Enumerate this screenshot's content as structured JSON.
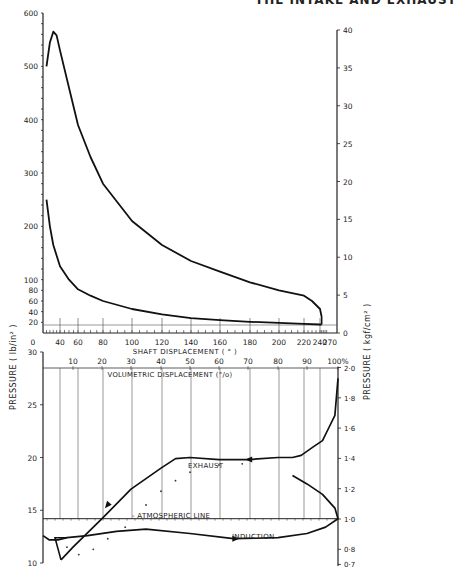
{
  "header": {
    "running_title": "THE INTAKE AND EXHAUST"
  },
  "chart_data": [
    {
      "type": "line",
      "title": "Cylinder pressure vs shaft displacement",
      "xlabel": "SHAFT DISPLACEMENT (°)",
      "ylabel": "PRESSURE (lb/in²)",
      "ylabel_right": "PRESSURE (kgf/cm²)",
      "xlim": [
        0,
        270
      ],
      "ylim": [
        0,
        600
      ],
      "ylim_right": [
        0,
        40
      ],
      "x_ticks": [
        "0",
        "40",
        "60",
        "80",
        "100",
        "120",
        "140",
        "160",
        "180",
        "200",
        "220",
        "240",
        "270"
      ],
      "y_ticks": [
        "20",
        "40",
        "60",
        "80",
        "100",
        "200",
        "300",
        "400",
        "500",
        "600"
      ],
      "y_ticks_right": [
        "0",
        "5",
        "10",
        "15",
        "20",
        "25",
        "30",
        "35",
        "40"
      ],
      "grid": false,
      "series": [
        {
          "name": "Expansion (upper curve)",
          "x": [
            20,
            25,
            30,
            35,
            40,
            50,
            60,
            70,
            80,
            100,
            120,
            140,
            160,
            180,
            200,
            220,
            230,
            240,
            245
          ],
          "values": [
            500,
            545,
            565,
            558,
            530,
            460,
            390,
            330,
            280,
            210,
            165,
            135,
            115,
            95,
            80,
            70,
            60,
            45,
            30
          ]
        },
        {
          "name": "Compression (lower curve)",
          "x": [
            20,
            25,
            30,
            40,
            50,
            60,
            70,
            80,
            100,
            120,
            140,
            160,
            180,
            200,
            220,
            240,
            245
          ],
          "values": [
            250,
            200,
            165,
            125,
            100,
            82,
            70,
            60,
            45,
            35,
            28,
            24,
            21,
            19,
            17,
            16,
            16
          ]
        }
      ]
    },
    {
      "type": "line",
      "title": "Low-pressure loop vs volumetric displacement",
      "xlabel": "VOLUMETRIC DISPLACEMENT (%)",
      "ylabel": "PRESSURE (lb/in²)",
      "ylabel_right": "PRESSURE (kgf/cm²)",
      "xlim": [
        0,
        100
      ],
      "ylim": [
        10,
        30
      ],
      "ylim_right": [
        0.7,
        2.0
      ],
      "x_ticks": [
        "10",
        "20",
        "30",
        "40",
        "50",
        "60",
        "70",
        "80",
        "90",
        "100%"
      ],
      "y_ticks": [
        "10",
        "15",
        "20",
        "25",
        "30"
      ],
      "y_ticks_right": [
        "0.7",
        "0.8",
        "1.0",
        "1.2",
        "1.4",
        "1.6",
        "1.8",
        "2.0"
      ],
      "grid": "vertical",
      "annotations": [
        "EXHAUST",
        "ATMOSPHERIC LINE",
        "INDUCTION"
      ],
      "atmospheric_line_lbin2": 14.2,
      "series": [
        {
          "name": "Exhaust",
          "x": [
            100,
            99,
            97,
            95,
            92,
            88,
            85,
            80,
            70,
            60,
            50,
            45,
            40,
            30,
            20,
            10,
            6
          ],
          "values": [
            27.5,
            24,
            22.8,
            21.6,
            21.0,
            20.2,
            20.0,
            20.0,
            19.8,
            19.8,
            20.0,
            19.9,
            19.0,
            17.0,
            14.2,
            11.5,
            10.3
          ]
        },
        {
          "name": "Induction",
          "x": [
            0,
            2,
            5,
            8,
            15,
            25,
            35,
            50,
            65,
            80,
            90,
            96,
            100,
            99,
            95,
            90,
            85
          ],
          "values": [
            12.6,
            12.2,
            12.2,
            12.4,
            12.6,
            13.0,
            13.2,
            12.8,
            12.3,
            12.4,
            12.8,
            13.4,
            14.2,
            15.2,
            16.5,
            17.5,
            18.3
          ]
        },
        {
          "name": "Dotted reference",
          "x": [
            8,
            12,
            17,
            22,
            28,
            35,
            40,
            45,
            50,
            60,
            68
          ],
          "values": [
            11.5,
            10.8,
            11.3,
            12.3,
            13.4,
            15.5,
            16.8,
            17.8,
            18.6,
            19.3,
            19.4
          ]
        }
      ]
    }
  ]
}
